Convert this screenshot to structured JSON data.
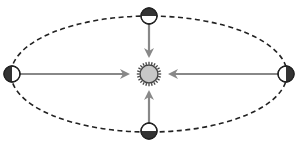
{
  "diagram": {
    "title": "Planet orbiting the Sun: gravitational force always directed toward the Sun",
    "orbit": {
      "shape": "ellipse",
      "style": "dashed",
      "color": "#222222",
      "cx": 149,
      "cy": 74,
      "rx": 138,
      "ry": 58
    },
    "sun": {
      "label": "Sun",
      "cx": 149,
      "cy": 74,
      "r": 9,
      "fill": "#c8c8c8",
      "ray_color": "#444444",
      "rays": 24
    },
    "arrow_color": "#888888",
    "planets": [
      {
        "id": "top",
        "label": "Planet at top of orbit",
        "cx": 149,
        "cy": 16,
        "r": 8,
        "dark_side": "top"
      },
      {
        "id": "bottom",
        "label": "Planet at bottom of orbit",
        "cx": 149,
        "cy": 131,
        "r": 8,
        "dark_side": "bottom"
      },
      {
        "id": "left",
        "label": "Planet at left of orbit",
        "cx": 12,
        "cy": 74,
        "r": 8,
        "dark_side": "left"
      },
      {
        "id": "right",
        "label": "Planet at right of orbit",
        "cx": 286,
        "cy": 74,
        "r": 8,
        "dark_side": "right"
      }
    ],
    "arrows": [
      {
        "from": "top",
        "x1": 149,
        "y1": 24,
        "x2": 149,
        "y2": 56
      },
      {
        "from": "bottom",
        "x1": 149,
        "y1": 123,
        "x2": 149,
        "y2": 92
      },
      {
        "from": "left",
        "x1": 20,
        "y1": 74,
        "x2": 128,
        "y2": 74
      },
      {
        "from": "right",
        "x1": 278,
        "y1": 74,
        "x2": 170,
        "y2": 74
      }
    ]
  }
}
